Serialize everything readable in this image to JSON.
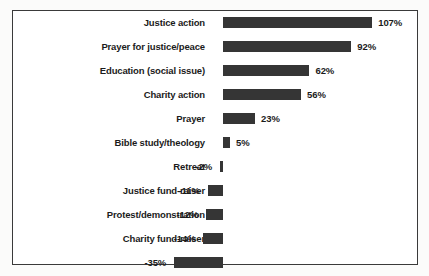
{
  "chart_data": {
    "type": "bar",
    "orientation": "horizontal",
    "title": "",
    "subtitle": "",
    "xlabel": "",
    "ylabel": "",
    "grid": false,
    "legend": false,
    "axis_visible": false,
    "value_suffix": "%",
    "zero_baseline": 0,
    "xlim": [
      -40,
      115
    ],
    "colors": {
      "bar": "#353535",
      "text": "#1b1b1b",
      "frame": "#3a3a3a",
      "plot_background": "#ffffff",
      "figure_background": "#fbfbfa"
    },
    "categories": [
      "Justice action",
      "Prayer for justice/peace",
      "Education (social issue)",
      "Charity action",
      "Prayer",
      "Bible study/theology",
      "Retreat",
      "Justice fund-raiser",
      "Protest/demonstration",
      "Charity fund-raiser",
      "Social"
    ],
    "values": [
      107,
      92,
      62,
      56,
      23,
      5,
      -2,
      -11,
      -12,
      -14,
      -35
    ],
    "data_labels": [
      "107%",
      "92%",
      "62%",
      "56%",
      "23%",
      "5%",
      "-2%",
      "-11%",
      "-12%",
      "-14%",
      "-35%"
    ],
    "points": [
      {
        "category": "Justice action",
        "value": 107,
        "label": "107%"
      },
      {
        "category": "Prayer for justice/peace",
        "value": 92,
        "label": "92%"
      },
      {
        "category": "Education (social issue)",
        "value": 62,
        "label": "62%"
      },
      {
        "category": "Charity action",
        "value": 56,
        "label": "56%"
      },
      {
        "category": "Prayer",
        "value": 23,
        "label": "23%"
      },
      {
        "category": "Bible study/theology",
        "value": 5,
        "label": "5%"
      },
      {
        "category": "Retreat",
        "value": -2,
        "label": "-2%"
      },
      {
        "category": "Justice fund-raiser",
        "value": -11,
        "label": "-11%"
      },
      {
        "category": "Protest/demonstration",
        "value": -12,
        "label": "-12%"
      },
      {
        "category": "Charity fund-raiser",
        "value": -14,
        "label": "-14%"
      },
      {
        "category": "Social",
        "value": -35,
        "label": "-35%"
      }
    ]
  }
}
